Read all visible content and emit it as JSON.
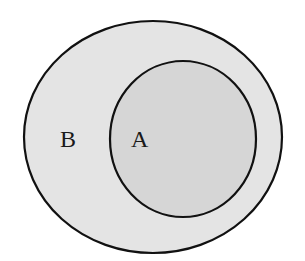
{
  "diagram": {
    "type": "venn-subset",
    "sets": [
      {
        "id": "B",
        "label": "B",
        "fill": "#e4e4e4",
        "stroke": "#111111",
        "cx": 153,
        "cy": 137,
        "rx": 129,
        "ry": 116
      },
      {
        "id": "A",
        "label": "A",
        "fill": "#d6d6d6",
        "stroke": "#111111",
        "cx": 183,
        "cy": 139,
        "rx": 73,
        "ry": 78
      }
    ],
    "labels": {
      "B": {
        "text": "B",
        "x": 60,
        "y": 147
      },
      "A": {
        "text": "A",
        "x": 131,
        "y": 147
      }
    }
  }
}
